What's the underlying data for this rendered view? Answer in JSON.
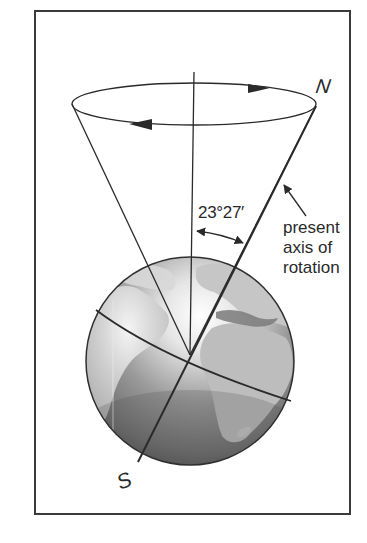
{
  "figure": {
    "labels": {
      "north": "N",
      "south": "S",
      "tilt_angle": "23°27′",
      "axis_label_lines": [
        "present",
        "axis of",
        "rotation"
      ]
    },
    "elements": {
      "frame": "rectangular border",
      "cone": "precession cone with elliptical base",
      "base_ellipse_arrows": [
        "clockwise-top-right",
        "leftward-bottom"
      ],
      "vertical_reference_line": "perpendicular to orbital plane",
      "axis_line": "present axis of rotation from S to N",
      "angle_arc": "double-headed arrow between vertical and axis",
      "pointer_arrow": "points from label to axis",
      "globe": "Earth showing Atlantic, Americas, Africa, Europe",
      "equator": "tilted equator line"
    },
    "colors": {
      "line": "#2a2a2a",
      "ocean": "#6e6e6e",
      "land": "#bcbcbc",
      "highlight": "#f4f4f4",
      "background": "#ffffff"
    }
  }
}
